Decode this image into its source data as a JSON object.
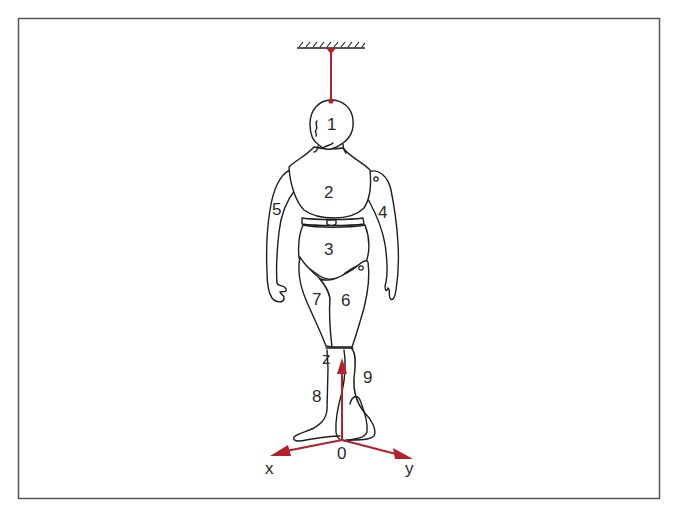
{
  "figure": {
    "colors": {
      "frame": "#555555",
      "outline": "#1e1e1e",
      "accent": "#b3222a",
      "background": "#ffffff"
    },
    "segments": [
      {
        "id": "1",
        "label": "1",
        "part": "head"
      },
      {
        "id": "2",
        "label": "2",
        "part": "upper-torso"
      },
      {
        "id": "3",
        "label": "3",
        "part": "pelvis"
      },
      {
        "id": "4",
        "label": "4",
        "part": "left-arm"
      },
      {
        "id": "5",
        "label": "5",
        "part": "right-arm"
      },
      {
        "id": "6",
        "label": "6",
        "part": "left-thigh"
      },
      {
        "id": "7",
        "label": "7",
        "part": "right-thigh"
      },
      {
        "id": "8",
        "label": "8",
        "part": "right-lower-leg"
      },
      {
        "id": "9",
        "label": "9",
        "part": "left-lower-leg"
      }
    ],
    "axes": {
      "origin_label": "0",
      "x_label": "x",
      "y_label": "y",
      "z_label": "z"
    }
  }
}
